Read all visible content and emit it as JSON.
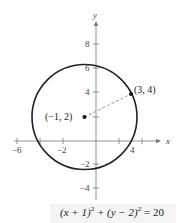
{
  "diagram": {
    "axes": {
      "x_label": "x",
      "y_label": "y",
      "x_ticks": [
        -6,
        -4,
        -2,
        2,
        4
      ],
      "x_tick_labels": [
        "−6",
        "−2",
        "4"
      ],
      "y_ticks": [
        8,
        6,
        4,
        2,
        -2,
        -4
      ],
      "y_tick_labels": [
        "8",
        "6",
        "4",
        "−2",
        "−4"
      ]
    },
    "circle": {
      "center": [
        -1,
        2
      ],
      "radius_squared": 20
    },
    "points": [
      {
        "label": "(−1, 2)",
        "x": -1,
        "y": 2
      },
      {
        "label": "(3, 4)",
        "x": 3,
        "y": 4
      }
    ],
    "equation": {
      "part1": "(x + 1)",
      "exp1": "2",
      "part2": " + (y − 2)",
      "exp2": "2",
      "part3": " = 20"
    },
    "colors": {
      "circle": "#222222",
      "axis": "#777777",
      "dashed": "#999999"
    }
  }
}
